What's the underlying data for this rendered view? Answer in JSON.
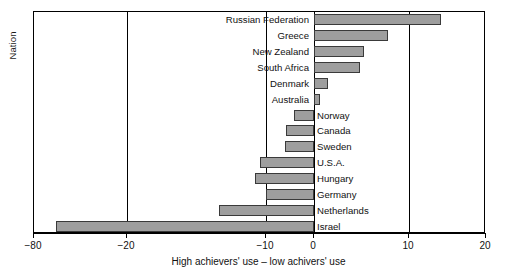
{
  "chart_data": {
    "type": "bar",
    "orientation": "horizontal",
    "title": "",
    "xlabel": "High achievers' use – low achivers' use",
    "ylabel": "Nation",
    "xlim": [
      -80,
      20
    ],
    "grid": false,
    "axis_note": "broken / piecewise x-axis: -80 to -20 compressed, -20 to -10 expanded",
    "xticks": [
      -80,
      -20,
      -10,
      0,
      10,
      20
    ],
    "xticklabels": [
      "−80",
      "−20",
      "−10",
      "0",
      "10",
      "20"
    ],
    "categories": [
      "Russian Federation",
      "Greece",
      "New Zealand",
      "South Africa",
      "Denmark",
      "Australia",
      "Norway",
      "Canada",
      "Sweden",
      "U.S.A.",
      "Hungary",
      "Germany",
      "Netherlands",
      "Israel"
    ],
    "values": [
      14.2,
      7.8,
      5.3,
      4.8,
      1.5,
      0.6,
      -4.2,
      -5.8,
      -6.0,
      -10.4,
      -10.8,
      -10.0,
      -13.4,
      -66.0
    ],
    "bar_color": "#9e9e9e",
    "bar_edge_color": "#3a3a3a",
    "background_color": "#ffffff",
    "frame_color": "#000000"
  }
}
